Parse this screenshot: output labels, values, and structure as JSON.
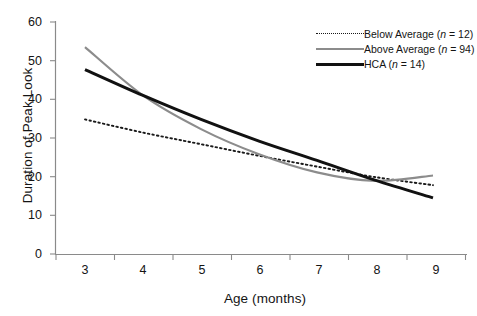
{
  "chart_data": {
    "type": "line",
    "title": "",
    "xlabel": "Age (months)",
    "ylabel": "Duration of Peak Look",
    "x": [
      3,
      4,
      5,
      6,
      7,
      8,
      9
    ],
    "xlim": [
      2.5,
      9.5
    ],
    "ylim": [
      0,
      60
    ],
    "yticks": [
      0,
      10,
      20,
      30,
      40,
      50,
      60
    ],
    "xticks": [
      3,
      4,
      5,
      6,
      7,
      8,
      9
    ],
    "grid": false,
    "legend_position": "top-right",
    "series": [
      {
        "name": "Below Average (n = 12)",
        "label_text": "Below Average",
        "label_n": "(n = 12)",
        "n": 12,
        "style": "dotted",
        "color": "#1a1a1a",
        "values": [
          34.8,
          31.4,
          28.4,
          25.4,
          22.6,
          19.9,
          17.8
        ]
      },
      {
        "name": "Above Average (n = 94)",
        "label_text": "Above Average",
        "label_n": "(n = 94)",
        "n": 94,
        "style": "solid",
        "color": "#8c8c8c",
        "values": [
          53.5,
          41.0,
          32.3,
          25.8,
          21.1,
          18.9,
          20.3
        ]
      },
      {
        "name": "HCA (n = 14)",
        "label_text": "HCA",
        "label_n": "(n = 14)",
        "n": 14,
        "style": "solid-bold",
        "color": "#111111",
        "values": [
          47.7,
          41.0,
          34.8,
          29.2,
          24.2,
          19.1,
          14.5
        ]
      }
    ],
    "ytick_labels": [
      "0",
      "10",
      "20",
      "30",
      "40",
      "50",
      "60"
    ],
    "xtick_labels": [
      "3",
      "4",
      "5",
      "6",
      "7",
      "8",
      "9"
    ]
  },
  "legend": {
    "items": [
      {
        "text": "Below Average",
        "stat": "(n = 12)",
        "n_italic": "n",
        "rest": " = 12)"
      },
      {
        "text": "Above Average",
        "stat": "(n = 94)",
        "n_italic": "n",
        "rest": " = 94)"
      },
      {
        "text": "HCA",
        "stat": "(n = 14)",
        "n_italic": "n",
        "rest": " = 14)"
      }
    ]
  },
  "colors": {
    "axis": "#808080",
    "below_average": "#1a1a1a",
    "above_average": "#8c8c8c",
    "hca": "#111111",
    "background": "#ffffff"
  }
}
